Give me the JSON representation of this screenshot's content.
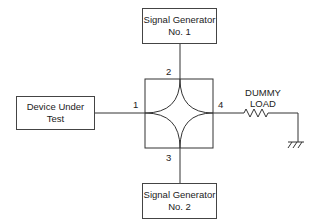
{
  "diagram": {
    "type": "hybrid-coupler test setup",
    "blocks": {
      "sig_gen_1": {
        "line1": "Signal Generator",
        "line2": "No. 1"
      },
      "sig_gen_2": {
        "line1": "Signal Generator",
        "line2": "No. 2"
      },
      "dut": {
        "line1": "Device Under",
        "line2": "Test"
      }
    },
    "ports": {
      "p1": "1",
      "p2": "2",
      "p3": "3",
      "p4": "4"
    },
    "load": {
      "line1": "DUMMY",
      "line2": "LOAD"
    },
    "symbols": [
      "resistor-icon",
      "ground-icon",
      "hybrid-coupler-icon"
    ],
    "line_color": "#333333"
  }
}
